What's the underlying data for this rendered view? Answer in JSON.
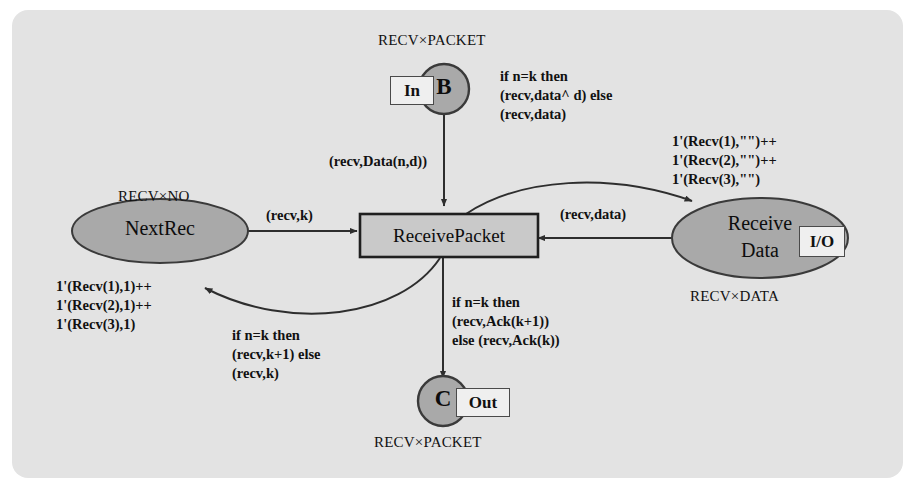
{
  "diagram": {
    "colors": {
      "panel_bg": "#e3e3e3",
      "node_fill": "#a9a9a9",
      "transition_fill": "#c9c9c9",
      "port_fill": "#efefef",
      "stroke": "#3a3a3a",
      "text": "#111111"
    }
  },
  "places": [
    {
      "id": "nextrec",
      "name": "NextRec",
      "shape": "ellipse",
      "type_label": "RECV×NO",
      "initial_marking": "1'(Recv(1),1)++\n1'(Recv(2),1)++\n1'(Recv(3),1)"
    },
    {
      "id": "receive-data",
      "name": "Receive\nData",
      "shape": "ellipse",
      "type_label": "RECV×DATA",
      "tag": "I/O",
      "initial_marking": "1'(Recv(1),\"\")++\n1'(Recv(2),\"\")++\n1'(Recv(3),\"\")"
    },
    {
      "id": "port-b",
      "name": "B",
      "shape": "circle",
      "type_label": "RECV×PACKET",
      "tag": "In"
    },
    {
      "id": "port-c",
      "name": "C",
      "shape": "circle",
      "type_label": "RECV×PACKET",
      "tag": "Out"
    }
  ],
  "transitions": [
    {
      "id": "receive-packet",
      "name": "ReceivePacket",
      "shape": "rectangle"
    }
  ],
  "arcs": [
    {
      "id": "arc-b-to-rp",
      "from": "port-b",
      "to": "receive-packet",
      "inscription": "(recv,Data(n,d))"
    },
    {
      "id": "arc-nextrec-to-rp",
      "from": "nextrec",
      "to": "receive-packet",
      "inscription": "(recv,k)"
    },
    {
      "id": "arc-receivedata-to-rp",
      "from": "receive-data",
      "to": "receive-packet",
      "inscription": "(recv,data)"
    },
    {
      "id": "arc-rp-to-receivedata",
      "from": "receive-packet",
      "to": "receive-data",
      "inscription": "if n=k then\n(recv,data^ d) else\n(recv,data)"
    },
    {
      "id": "arc-rp-to-nextrec",
      "from": "receive-packet",
      "to": "nextrec",
      "inscription": "if n=k then\n(recv,k+1) else\n(recv,k)"
    },
    {
      "id": "arc-rp-to-c",
      "from": "receive-packet",
      "to": "port-c",
      "inscription": "if n=k then\n(recv,Ack(k+1))\nelse (recv,Ack(k))"
    }
  ],
  "labels": {
    "b_type": "RECV×PACKET",
    "c_type": "RECV×PACKET",
    "nextrec_type": "RECV×NO",
    "receivedata_type": "RECV×DATA",
    "b_tag": "In",
    "c_tag": "Out",
    "io_tag": "I/O",
    "b_name": "B",
    "c_name": "C",
    "nextrec_name": "NextRec",
    "receivedata_name_line1": "Receive",
    "receivedata_name_line2": "Data",
    "transition_name": "ReceivePacket",
    "nextrec_marking_l1": "1'(Recv(1),1)++",
    "nextrec_marking_l2": "1'(Recv(2),1)++",
    "nextrec_marking_l3": "1'(Recv(3),1)",
    "receivedata_marking_l1": "1'(Recv(1),\"\")++",
    "receivedata_marking_l2": "1'(Recv(2),\"\")++",
    "receivedata_marking_l3": "1'(Recv(3),\"\")",
    "insc_top_right_l1": "if n=k then",
    "insc_top_right_l2": "(recv,data^ d) else",
    "insc_top_right_l3": "(recv,data)",
    "insc_bottom_left_l1": "if n=k then",
    "insc_bottom_left_l2": "(recv,k+1) else",
    "insc_bottom_left_l3": "(recv,k)",
    "insc_bottom_center_l1": "if n=k then",
    "insc_bottom_center_l2": "(recv,Ack(k+1))",
    "insc_bottom_center_l3": "else (recv,Ack(k))",
    "arc_b_value": "(recv,Data(n,d))",
    "arc_nextrec_value": "(recv,k)",
    "arc_receivedata_value": "(recv,data)"
  }
}
